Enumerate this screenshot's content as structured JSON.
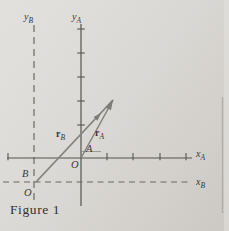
{
  "figure": {
    "caption": "Figure 1",
    "colors": {
      "axis": "#56544e",
      "dashed": "#6b6963",
      "vector": "#84827c",
      "arrowhead": "#7d7b75",
      "text": "#3b3934",
      "faint": "#94928c",
      "page_edge": "#b0aeaa"
    },
    "axes": [
      {
        "name": "y-axis-frame-B",
        "kind": "dashed",
        "x1": 34,
        "y1": 25,
        "x2": 34,
        "y2": 205,
        "dash": "7,5",
        "width": 1.2
      },
      {
        "name": "y-axis-frame-A",
        "kind": "solid",
        "x1": 81,
        "y1": 24,
        "x2": 81,
        "y2": 206,
        "width": 1.2
      },
      {
        "name": "x-axis-frame-A",
        "kind": "solid",
        "x1": 7,
        "y1": 158,
        "x2": 192,
        "y2": 158,
        "width": 1.2
      },
      {
        "name": "x-axis-frame-B",
        "kind": "dashed",
        "x1": 3,
        "y1": 182,
        "x2": 190,
        "y2": 182,
        "dash": "6,4.5",
        "width": 1.2
      }
    ],
    "ticks": [
      {
        "name": "y-axis-A-ticks",
        "orient": "h",
        "x": 81,
        "half": 3.8,
        "positions": [
          29,
          53,
          77,
          101,
          125
        ]
      },
      {
        "name": "x-axis-A-ticks",
        "orient": "v",
        "y": 158,
        "up": 5,
        "down": 2.2,
        "positions": [
          8,
          107,
          133,
          160,
          186
        ]
      }
    ],
    "vectors": [
      {
        "name": "vector-r-B",
        "label": "r",
        "sub": "B",
        "from": [
          36,
          182
        ],
        "to": [
          113,
          100
        ],
        "head": [
          101,
          113
        ],
        "head_len": 8,
        "head_halfw": 2.7,
        "shaft_w": 1.8,
        "label_x": 56,
        "label_y": 137
      },
      {
        "name": "vector-r-A",
        "label": "r",
        "sub": "A",
        "from": [
          81,
          158
        ],
        "to": [
          113,
          100
        ],
        "head": [
          113,
          100
        ],
        "head_len": 10,
        "head_halfw": 3.2,
        "shaft_w": 1.5,
        "label_x": 95,
        "label_y": 136
      }
    ],
    "labels": [
      {
        "name": "label-y-B",
        "text": "y",
        "sub": "B",
        "x": 24,
        "y": 20,
        "style": "axis"
      },
      {
        "name": "label-y-A",
        "text": "y",
        "sub": "A",
        "x": 72,
        "y": 20,
        "style": "axis"
      },
      {
        "name": "label-x-A",
        "text": "x",
        "sub": "A",
        "x": 196,
        "y": 157,
        "style": "axis"
      },
      {
        "name": "label-x-B",
        "text": "x",
        "sub": "B",
        "x": 196,
        "y": 185,
        "style": "axis"
      },
      {
        "name": "label-origin-A",
        "text": "O",
        "x": 71,
        "y": 168,
        "style": "point"
      },
      {
        "name": "label-point-A",
        "text": "A",
        "x": 86,
        "y": 152,
        "style": "point"
      },
      {
        "name": "label-point-B",
        "text": "B",
        "x": 22,
        "y": 177,
        "style": "point"
      },
      {
        "name": "label-origin-B",
        "text": "O",
        "x": 24,
        "y": 196,
        "style": "point"
      }
    ],
    "artifacts": [
      {
        "name": "segment-under-A",
        "x1": 82,
        "y1": 151.5,
        "x2": 101,
        "y2": 151.5,
        "width": 0.9,
        "color_key": "faint"
      },
      {
        "name": "page-edge-line",
        "x1": 222.5,
        "y1": 97,
        "x2": 222.5,
        "y2": 213,
        "width": 1.4,
        "color_key": "page_edge"
      }
    ]
  }
}
